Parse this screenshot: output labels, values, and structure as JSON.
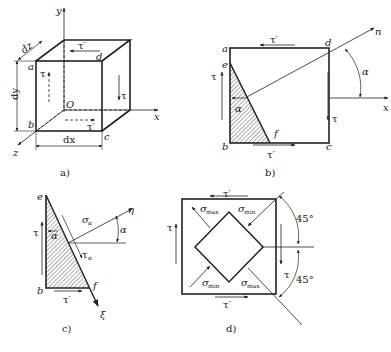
{
  "figure": {
    "panels": [
      {
        "id": "a",
        "caption": "a)",
        "labels": {
          "y": "y",
          "x": "x",
          "z": "z",
          "origin": "O",
          "dz": "dz",
          "dy": "dy",
          "dx": "dx",
          "a": "a",
          "b": "b",
          "c": "c",
          "d": "d",
          "tau": "τ",
          "tau_prime": "τ′"
        }
      },
      {
        "id": "b",
        "caption": "b)",
        "labels": {
          "a": "a",
          "b": "b",
          "c": "c",
          "d": "d",
          "e": "e",
          "f": "f",
          "n": "n",
          "x": "x",
          "alpha": "α",
          "tau": "τ",
          "tau_prime": "τ′"
        }
      },
      {
        "id": "c",
        "caption": "c)",
        "labels": {
          "e": "e",
          "b": "b",
          "f": "f",
          "eta": "η",
          "xi": "ξ",
          "alpha": "α",
          "tau": "τ",
          "tau_prime": "τ′",
          "sigma": "σ",
          "sigma_sub": "α",
          "tau_a": "τ",
          "tau_a_sub": "α"
        }
      },
      {
        "id": "d",
        "caption": "d)",
        "labels": {
          "tau": "τ",
          "tau_prime": "τ′",
          "sigma": "σ",
          "max": "max",
          "min": "min",
          "angle_top": "45°",
          "angle_bottom": "45°"
        }
      }
    ]
  }
}
